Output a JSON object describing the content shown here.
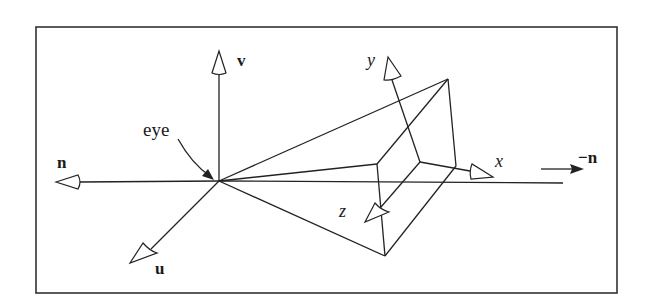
{
  "figure": {
    "labels": {
      "v_axis": "v",
      "n_axis": "n",
      "u_axis": "u",
      "neg_n": "−n",
      "eye": "eye",
      "x_axis": "x",
      "y_axis": "y",
      "z_axis": "z"
    },
    "colors": {
      "line": "#222222",
      "background": "#ffffff"
    }
  }
}
